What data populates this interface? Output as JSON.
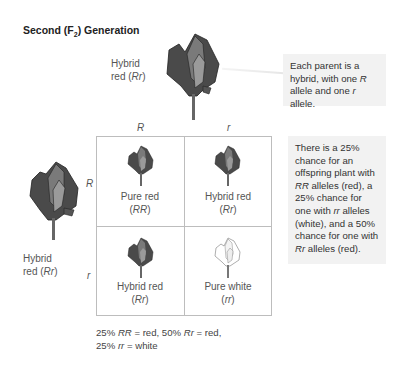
{
  "title": {
    "prefix": "Second (F",
    "subscript": "2",
    "suffix": ") Generation"
  },
  "top_parent": {
    "line1": "Hybrid",
    "line2_prefix": "red (",
    "genotype": "Rr",
    "line2_suffix": ")",
    "flower_color": "red"
  },
  "left_parent": {
    "line1": "Hybrid",
    "line2_prefix": "red (",
    "genotype": "Rr",
    "line2_suffix": ")",
    "flower_color": "red"
  },
  "column_alleles": [
    "R",
    "r"
  ],
  "row_alleles": [
    "R",
    "r"
  ],
  "punnett_cells": [
    {
      "phenotype": "Pure red",
      "genotype": "RR",
      "flower_color": "red"
    },
    {
      "phenotype": "Hybrid red",
      "genotype": "Rr",
      "flower_color": "red"
    },
    {
      "phenotype": "Hybrid red",
      "genotype": "Rr",
      "flower_color": "red"
    },
    {
      "phenotype": "Pure white",
      "genotype": "rr",
      "flower_color": "white"
    }
  ],
  "callout_parent": {
    "part1": "Each parent is a hybrid, with one ",
    "allele_R": "R",
    "part2": " allele and one ",
    "allele_r": "r",
    "part3": " allele."
  },
  "callout_offspring": {
    "part1": "There is a 25% chance for an offspring plant with ",
    "g1": "RR",
    "part2": " alleles (red), a 25% chance for one with ",
    "g2": "rr",
    "part3": " alleles (white), and a 50% chance for one with ",
    "g3": "Rr",
    "part4": " alleles (red)."
  },
  "summary": {
    "p1": "25% ",
    "g1": "RR",
    "p2": " = red, 50% ",
    "g2": "Rr",
    "p3": " = red,",
    "p4": "25% ",
    "g3": "rr",
    "p5": " = white"
  },
  "colors": {
    "flower_dark": "#3a3a3a",
    "flower_mid": "#6a6a6a",
    "flower_light": "#9a9a9a",
    "white_flower_outline": "#777777",
    "grid_line": "#bdbdbd",
    "callout_bg": "#f2f2f2"
  }
}
